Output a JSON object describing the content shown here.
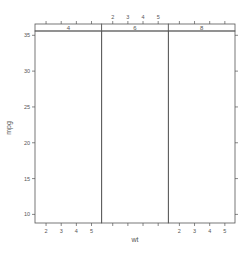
{
  "chart_data": {
    "type": "scatter",
    "title": "",
    "xlabel": "wt",
    "ylabel": "mpg",
    "panels": [
      {
        "strip_label": "4",
        "points": []
      },
      {
        "strip_label": "6",
        "points": []
      },
      {
        "strip_label": "8",
        "points": []
      }
    ],
    "x_ticks": [
      2,
      3,
      4,
      5
    ],
    "y_ticks": [
      10,
      15,
      20,
      25,
      30,
      35
    ],
    "xlim": [
      1.27,
      5.67
    ],
    "ylim": [
      8.8,
      35.6
    ],
    "grid": false,
    "legend": null,
    "x_tick_labels_bottom_panels": [
      0,
      2
    ],
    "x_tick_labels_top_panels": [
      1
    ]
  },
  "colors": {
    "axis": "#555555",
    "strip_bg": "#ffffff",
    "background": "#ffffff"
  }
}
